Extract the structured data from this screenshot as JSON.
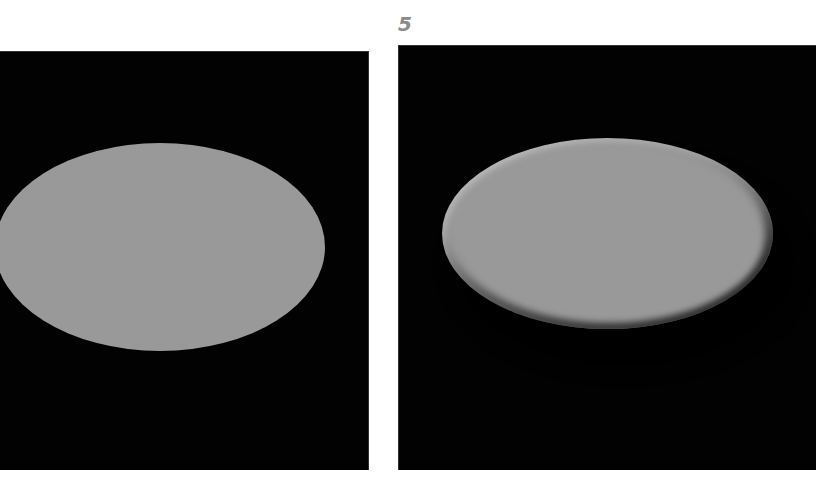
{
  "figure": {
    "number_label": "5",
    "colors": {
      "background": "#ffffff",
      "panel": "#020202",
      "ellipse_fill": "#999999",
      "highlight": "#e4e4e4",
      "number_label": "#8a8a8a"
    },
    "panels": [
      {
        "id": "left",
        "shape": "ellipse",
        "style": "flat"
      },
      {
        "id": "right",
        "shape": "ellipse",
        "style": "embossed-bevel"
      }
    ]
  }
}
